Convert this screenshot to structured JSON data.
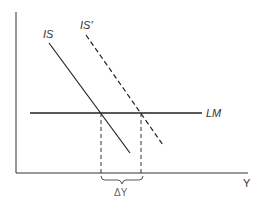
{
  "diagram": {
    "type": "IS-LM shift diagram",
    "curves": {
      "is": {
        "label": "IS",
        "style": "solid"
      },
      "is_prime": {
        "label": "IS'",
        "style": "dashed"
      },
      "lm": {
        "label": "LM",
        "style": "solid-horizontal"
      }
    },
    "axes": {
      "x_label": "Y",
      "y_label": ""
    },
    "annotation": {
      "delta_label": "ΔY"
    },
    "colors": {
      "line": "#333333",
      "background": "#ffffff"
    }
  }
}
